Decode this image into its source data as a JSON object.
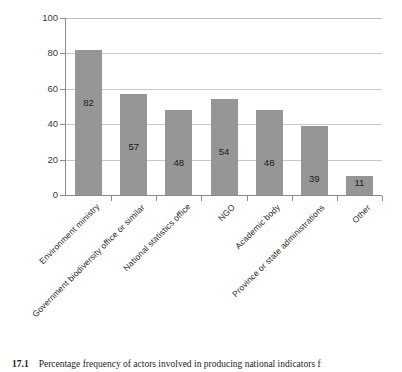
{
  "chart_data": {
    "type": "bar",
    "title": "",
    "xlabel": "",
    "ylabel": "",
    "ylim": [
      0,
      100
    ],
    "yticks": [
      0,
      20,
      40,
      60,
      80,
      100
    ],
    "ytick_labels": [
      "0",
      "20",
      "40",
      "60",
      "80",
      "100"
    ],
    "grid": true,
    "grid_axis": "y",
    "legend": false,
    "legend_position": "none",
    "orientation": "vertical",
    "bar_color": "#969696",
    "categories": [
      "Environment ministry",
      "Government biodiversity office or similar",
      "National statistics office",
      "NGO",
      "Academic body",
      "Province or state administrations",
      "Other"
    ],
    "values": [
      82,
      57,
      48,
      54,
      48,
      39,
      11
    ],
    "data_labels": [
      "82",
      "57",
      "48",
      "54",
      "48",
      "39",
      "11"
    ],
    "data_label_position": "inside"
  },
  "caption": {
    "number": "17.1",
    "text": "Percentage frequency of actors involved in producing national indicators f"
  },
  "colors": {
    "bar": "#969696",
    "gridline": "#c9c9c9",
    "axis": "#8a8a8a",
    "background": "#ffffff",
    "text": "#222222"
  }
}
